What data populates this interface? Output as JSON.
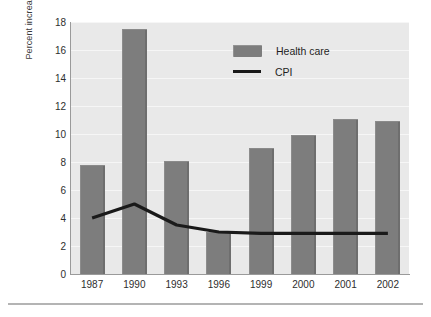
{
  "chart_data": {
    "type": "bar",
    "title": "",
    "subtitle": "",
    "xlabel": "",
    "ylabel": "Percent increase",
    "categories": [
      "1987",
      "1990",
      "1993",
      "1996",
      "1999",
      "2000",
      "2001",
      "2002"
    ],
    "ylim": [
      0,
      18
    ],
    "yticks": [
      0,
      2,
      4,
      6,
      8,
      10,
      12,
      14,
      16,
      18
    ],
    "ytick_labels": [
      "0",
      "2",
      "4",
      "6",
      "8",
      "10",
      "12",
      "14",
      "16",
      "18"
    ],
    "grid": true,
    "grid_axis": "y",
    "legend_position": "top-right",
    "series": [
      {
        "name": "Health care",
        "type": "bar",
        "color": "#7d7d7d",
        "values": [
          7.8,
          17.5,
          8.1,
          3.0,
          9.0,
          9.9,
          11.1,
          10.9
        ]
      },
      {
        "name": "CPI",
        "type": "line",
        "color": "#1a1a1a",
        "values": [
          4.0,
          5.0,
          3.5,
          3.0,
          2.9,
          2.9,
          2.9,
          2.9
        ]
      }
    ]
  },
  "legend": {
    "items": [
      {
        "label": "Health care",
        "marker": "bar-swatch"
      },
      {
        "label": "CPI",
        "marker": "line-swatch"
      }
    ]
  },
  "axes": {
    "y_title": "Percent increase"
  },
  "colors": {
    "bar_fill": "#7d7d7d",
    "line_stroke": "#1a1a1a",
    "plot_background": "#e9e9e9",
    "gridline": "#f6f6f6",
    "axis_line": "#9a9a9a",
    "page_background": "#ffffff",
    "rule": "#b4b4b4"
  }
}
